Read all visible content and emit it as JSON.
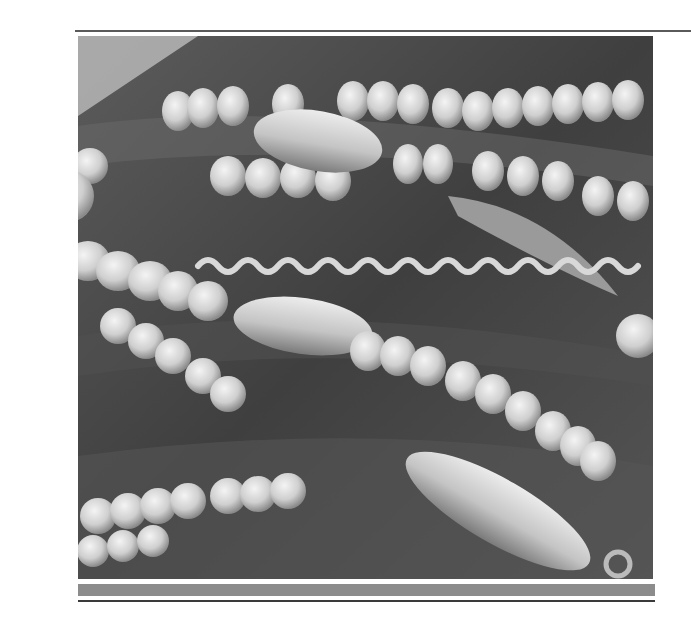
{
  "figure": {
    "description": "Scanning electron micrograph of filamentous cyanobacteria: bead-like chains of rounded cells, a spiral (corkscrew) filament, and elongated spindle-shaped cells over a textured substrate",
    "colors": {
      "top_rule": "#5a5a5a",
      "photo_background": "#4a4a4a",
      "band": "#8c8c8c",
      "bottom_rule": "#3a3a3a",
      "page": "#ffffff"
    }
  }
}
